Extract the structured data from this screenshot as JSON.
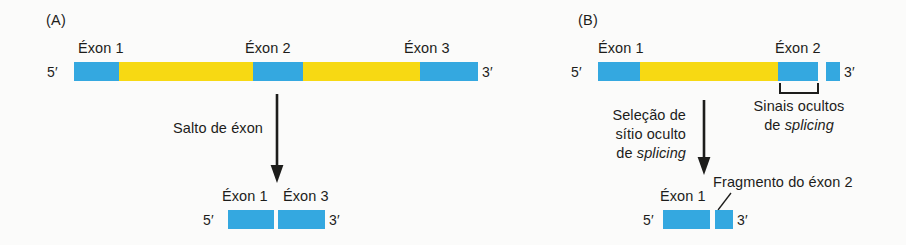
{
  "figure": {
    "panels": [
      {
        "id": "A",
        "label": "(A)",
        "pre_mrna": {
          "five_prime": "5′",
          "three_prime": "3′",
          "exon_labels": [
            "Éxon 1",
            "Éxon 2",
            "Éxon 3"
          ]
        },
        "process_label": "Salto de éxon",
        "product": {
          "five_prime": "5′",
          "three_prime": "3′",
          "exon_labels": [
            "Éxon 1",
            "Éxon 3"
          ]
        }
      },
      {
        "id": "B",
        "label": "(B)",
        "pre_mrna": {
          "five_prime": "5′",
          "three_prime": "3′",
          "exon_labels": [
            "Éxon 1",
            "Éxon 2"
          ]
        },
        "process_label_line1": "Seleção de",
        "process_label_line2": "sítio oculto",
        "process_label_line3_plain": "de ",
        "process_label_line3_italic": "splicing",
        "cryptic_label_line1": "Sinais ocultos",
        "cryptic_label_line2_plain": "de ",
        "cryptic_label_line2_italic": "splicing",
        "product": {
          "five_prime": "5′",
          "three_prime": "3′",
          "exon_label": "Éxon 1",
          "fragment_label": "Fragmento do éxon 2"
        }
      }
    ],
    "colors": {
      "exon": "#34a8e0",
      "intron": "#f7d913",
      "text": "#1d1d1b",
      "background": "#fbfbfa"
    }
  }
}
